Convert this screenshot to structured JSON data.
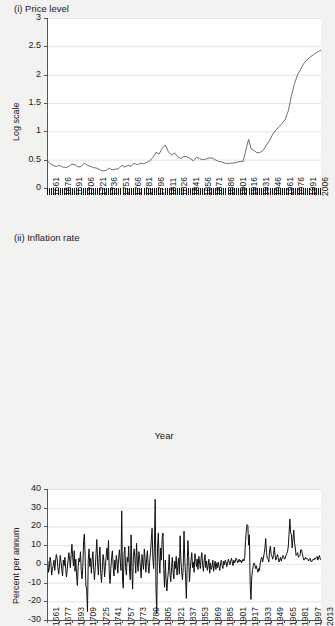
{
  "panels": {
    "price": {
      "title": "(i) Price level",
      "ylabel": "Log scale",
      "ytick_labels": [
        "3",
        "2.5",
        "2",
        "1.5",
        "1",
        "0.5",
        "0"
      ],
      "xtick_labels": [
        "1661",
        "1676",
        "1691",
        "1706",
        "1721",
        "1736",
        "1751",
        "1766",
        "1781",
        "1796",
        "1811",
        "1826",
        "1841",
        "1856",
        "1871",
        "1886",
        "1901",
        "1916",
        "1931",
        "1946",
        "1961",
        "1976",
        "1991",
        "2006"
      ]
    },
    "inflation": {
      "title": "(ii) Inflation rate",
      "ylabel": "Percent per annum",
      "xaxis_title": "Year",
      "ytick_labels": [
        "40",
        "30",
        "20",
        "10",
        "0",
        "-10",
        "-20",
        "-30"
      ],
      "xtick_labels": [
        "1661",
        "1677",
        "1693",
        "1709",
        "1725",
        "1741",
        "1757",
        "1773",
        "1789",
        "1805",
        "1821",
        "1837",
        "1853",
        "1869",
        "1885",
        "1901",
        "1917",
        "1933",
        "1949",
        "1965",
        "1981",
        "1997",
        "2013"
      ]
    }
  },
  "colors": {
    "page_background": "#f2f2f0",
    "plot_background": "#ffffff",
    "gridline": "#e3e3e3",
    "axis": "#55565a",
    "price_line": "#6e6e70",
    "inflation_line": "#111111",
    "text": "#1a1a1a"
  },
  "chart_data": [
    {
      "type": "line",
      "title": "(i) Price level",
      "xlabel": "",
      "ylabel": "Log scale",
      "xlim": [
        1661,
        2013
      ],
      "ylim": [
        0,
        3
      ],
      "yticks": [
        0,
        0.5,
        1,
        1.5,
        2,
        2.5,
        3
      ],
      "xticks": [
        1661,
        1676,
        1691,
        1706,
        1721,
        1736,
        1751,
        1766,
        1781,
        1796,
        1811,
        1826,
        1841,
        1856,
        1871,
        1886,
        1901,
        1916,
        1931,
        1946,
        1961,
        1976,
        1991,
        2006
      ],
      "grid": true,
      "legend": "none",
      "series": [
        {
          "name": "Price level (log scale)",
          "x": [
            1661,
            1665,
            1669,
            1673,
            1677,
            1681,
            1685,
            1689,
            1693,
            1697,
            1701,
            1705,
            1709,
            1713,
            1717,
            1721,
            1725,
            1729,
            1733,
            1737,
            1741,
            1745,
            1749,
            1753,
            1757,
            1761,
            1765,
            1769,
            1773,
            1777,
            1781,
            1785,
            1789,
            1793,
            1797,
            1801,
            1805,
            1809,
            1813,
            1817,
            1821,
            1825,
            1829,
            1833,
            1837,
            1841,
            1845,
            1849,
            1853,
            1857,
            1861,
            1865,
            1869,
            1873,
            1877,
            1881,
            1885,
            1889,
            1893,
            1897,
            1901,
            1905,
            1909,
            1913,
            1917,
            1920,
            1923,
            1927,
            1931,
            1935,
            1939,
            1943,
            1947,
            1951,
            1955,
            1959,
            1963,
            1967,
            1971,
            1975,
            1979,
            1983,
            1987,
            1991,
            1995,
            1999,
            2003,
            2007,
            2011,
            2013
          ],
          "y": [
            0.49,
            0.43,
            0.4,
            0.38,
            0.4,
            0.37,
            0.36,
            0.38,
            0.42,
            0.41,
            0.37,
            0.38,
            0.44,
            0.4,
            0.38,
            0.36,
            0.35,
            0.32,
            0.3,
            0.31,
            0.35,
            0.32,
            0.33,
            0.34,
            0.4,
            0.37,
            0.4,
            0.38,
            0.44,
            0.41,
            0.44,
            0.43,
            0.45,
            0.48,
            0.54,
            0.63,
            0.6,
            0.7,
            0.76,
            0.64,
            0.58,
            0.62,
            0.55,
            0.52,
            0.56,
            0.55,
            0.52,
            0.48,
            0.54,
            0.52,
            0.5,
            0.51,
            0.53,
            0.53,
            0.5,
            0.47,
            0.46,
            0.44,
            0.43,
            0.44,
            0.44,
            0.45,
            0.47,
            0.47,
            0.7,
            0.86,
            0.7,
            0.66,
            0.62,
            0.63,
            0.67,
            0.76,
            0.84,
            0.95,
            1.02,
            1.08,
            1.14,
            1.21,
            1.36,
            1.63,
            1.84,
            2.0,
            2.1,
            2.2,
            2.26,
            2.31,
            2.35,
            2.39,
            2.42,
            2.43
          ]
        }
      ]
    },
    {
      "type": "line",
      "title": "(ii) Inflation rate",
      "xlabel": "Year",
      "ylabel": "Percent per annum",
      "xlim": [
        1661,
        2013
      ],
      "ylim": [
        -30,
        40
      ],
      "yticks": [
        -30,
        -20,
        -10,
        0,
        10,
        20,
        30,
        40
      ],
      "xticks": [
        1661,
        1677,
        1693,
        1709,
        1725,
        1741,
        1757,
        1773,
        1789,
        1805,
        1821,
        1837,
        1853,
        1869,
        1885,
        1901,
        1917,
        1933,
        1949,
        1965,
        1981,
        1997,
        2013
      ],
      "grid": true,
      "legend": "none",
      "annotations": [
        {
          "label": "1709 dearth",
          "x": 1709,
          "y": -25.5
        },
        {
          "label": "1757 harvest failure",
          "x": 1757,
          "y": 28.3
        },
        {
          "label": "1800 scarcity",
          "x": 1800,
          "y": 34.5
        },
        {
          "label": "1802 collapse",
          "x": 1802,
          "y": -26.5
        },
        {
          "label": "WWI peak",
          "x": 1917,
          "y": 21.0
        },
        {
          "label": "1921 deflation",
          "x": 1921,
          "y": -19.0
        },
        {
          "label": "1975 peak",
          "x": 1975,
          "y": 24.0
        }
      ],
      "series": [
        {
          "name": "Inflation rate (percent per annum)",
          "x": [
            1661,
            1662,
            1663,
            1664,
            1665,
            1666,
            1667,
            1668,
            1669,
            1670,
            1671,
            1672,
            1673,
            1674,
            1675,
            1676,
            1677,
            1678,
            1679,
            1680,
            1681,
            1682,
            1683,
            1684,
            1685,
            1686,
            1687,
            1688,
            1689,
            1690,
            1691,
            1692,
            1693,
            1694,
            1695,
            1696,
            1697,
            1698,
            1699,
            1700,
            1701,
            1702,
            1703,
            1704,
            1705,
            1706,
            1707,
            1708,
            1709,
            1710,
            1711,
            1712,
            1713,
            1714,
            1715,
            1716,
            1717,
            1718,
            1719,
            1720,
            1721,
            1722,
            1723,
            1724,
            1725,
            1726,
            1727,
            1728,
            1729,
            1730,
            1731,
            1732,
            1733,
            1734,
            1735,
            1736,
            1737,
            1738,
            1739,
            1740,
            1741,
            1742,
            1743,
            1744,
            1745,
            1746,
            1747,
            1748,
            1749,
            1750,
            1751,
            1752,
            1753,
            1754,
            1755,
            1756,
            1757,
            1758,
            1759,
            1760,
            1761,
            1762,
            1763,
            1764,
            1765,
            1766,
            1767,
            1768,
            1769,
            1770,
            1771,
            1772,
            1773,
            1774,
            1775,
            1776,
            1777,
            1778,
            1779,
            1780,
            1781,
            1782,
            1783,
            1784,
            1785,
            1786,
            1787,
            1788,
            1789,
            1790,
            1791,
            1792,
            1793,
            1794,
            1795,
            1796,
            1797,
            1798,
            1799,
            1800,
            1801,
            1802,
            1803,
            1804,
            1805,
            1806,
            1807,
            1808,
            1809,
            1810,
            1811,
            1812,
            1813,
            1814,
            1815,
            1816,
            1817,
            1818,
            1819,
            1820,
            1821,
            1822,
            1823,
            1824,
            1825,
            1826,
            1827,
            1828,
            1829,
            1830,
            1831,
            1832,
            1833,
            1834,
            1835,
            1836,
            1837,
            1838,
            1839,
            1840,
            1841,
            1842,
            1843,
            1844,
            1845,
            1846,
            1847,
            1848,
            1849,
            1850,
            1851,
            1852,
            1853,
            1854,
            1855,
            1856,
            1857,
            1858,
            1859,
            1860,
            1861,
            1862,
            1863,
            1864,
            1865,
            1866,
            1867,
            1868,
            1869,
            1870,
            1871,
            1872,
            1873,
            1874,
            1875,
            1876,
            1877,
            1878,
            1879,
            1880,
            1881,
            1882,
            1883,
            1884,
            1885,
            1886,
            1887,
            1888,
            1889,
            1890,
            1891,
            1892,
            1893,
            1894,
            1895,
            1896,
            1897,
            1898,
            1899,
            1900,
            1901,
            1902,
            1903,
            1904,
            1905,
            1906,
            1907,
            1908,
            1909,
            1910,
            1911,
            1912,
            1913,
            1914,
            1915,
            1916,
            1917,
            1918,
            1919,
            1920,
            1921,
            1922,
            1923,
            1924,
            1925,
            1926,
            1927,
            1928,
            1929,
            1930,
            1931,
            1932,
            1933,
            1934,
            1935,
            1936,
            1937,
            1938,
            1939,
            1940,
            1941,
            1942,
            1943,
            1944,
            1945,
            1946,
            1947,
            1948,
            1949,
            1950,
            1951,
            1952,
            1953,
            1954,
            1955,
            1956,
            1957,
            1958,
            1959,
            1960,
            1961,
            1962,
            1963,
            1964,
            1965,
            1966,
            1967,
            1968,
            1969,
            1970,
            1971,
            1972,
            1973,
            1974,
            1975,
            1976,
            1977,
            1978,
            1979,
            1980,
            1981,
            1982,
            1983,
            1984,
            1985,
            1986,
            1987,
            1988,
            1989,
            1990,
            1991,
            1992,
            1993,
            1994,
            1995,
            1996,
            1997,
            1998,
            1999,
            2000,
            2001,
            2002,
            2003,
            2004,
            2005,
            2006,
            2007,
            2008,
            2009,
            2010,
            2011,
            2012,
            2013
          ],
          "y": [
            -3.0,
            1.5,
            -4.5,
            -2.0,
            3.5,
            1.0,
            -6.0,
            -2.5,
            -1.0,
            2.0,
            -3.5,
            1.5,
            5.0,
            3.0,
            -2.0,
            -5.5,
            -1.5,
            4.5,
            1.0,
            -3.0,
            -6.5,
            2.0,
            -1.0,
            3.5,
            -2.5,
            -7.0,
            -3.0,
            1.5,
            6.0,
            3.0,
            -2.0,
            5.0,
            10.5,
            3.5,
            -1.0,
            7.0,
            -4.0,
            2.5,
            -6.0,
            -11.5,
            -2.0,
            3.0,
            1.0,
            6.5,
            -3.5,
            -8.0,
            -2.0,
            12.0,
            16.0,
            4.0,
            -12.0,
            -13.5,
            -25.5,
            2.0,
            8.0,
            -1.5,
            3.0,
            -5.0,
            2.5,
            6.5,
            -3.0,
            -8.5,
            -2.0,
            5.5,
            13.0,
            0.5,
            -6.0,
            3.0,
            9.0,
            -4.5,
            -10.0,
            -3.0,
            5.0,
            2.0,
            -7.0,
            -1.5,
            4.0,
            8.5,
            2.0,
            12.5,
            -5.0,
            -10.5,
            -2.5,
            3.5,
            7.0,
            -1.0,
            -6.5,
            2.0,
            -3.0,
            4.5,
            1.0,
            -5.0,
            3.0,
            7.5,
            2.0,
            -3.5,
            28.3,
            -8.0,
            -13.0,
            5.0,
            9.0,
            -2.0,
            -6.0,
            3.5,
            1.0,
            9.5,
            -4.0,
            -8.5,
            15.5,
            -2.0,
            -13.5,
            4.0,
            8.0,
            2.5,
            -5.0,
            11.0,
            1.5,
            -4.0,
            6.5,
            3.0,
            -2.0,
            -7.5,
            5.0,
            1.0,
            -3.0,
            8.0,
            2.5,
            -4.5,
            3.0,
            7.0,
            -1.5,
            -5.0,
            2.0,
            6.0,
            13.0,
            19.0,
            3.0,
            -2.5,
            10.0,
            34.5,
            -13.0,
            -26.5,
            9.0,
            16.5,
            3.0,
            -5.0,
            8.5,
            2.0,
            14.0,
            16.5,
            -3.0,
            -12.5,
            2.0,
            -9.0,
            -14.5,
            -8.0,
            -3.5,
            5.0,
            -6.0,
            -9.5,
            -2.0,
            3.5,
            -4.5,
            -8.0,
            1.5,
            -2.5,
            4.0,
            -6.0,
            -1.0,
            3.0,
            -5.5,
            15.0,
            2.0,
            -4.0,
            -8.5,
            -2.0,
            17.5,
            3.0,
            -6.5,
            -18.5,
            -3.0,
            12.5,
            4.0,
            -9.5,
            -3.0,
            2.0,
            6.0,
            -2.0,
            1.0,
            -4.5,
            5.5,
            3.0,
            -1.5,
            2.5,
            -3.0,
            4.0,
            1.0,
            -2.5,
            3.5,
            6.0,
            -1.0,
            -4.0,
            2.0,
            5.0,
            -2.0,
            1.5,
            -3.5,
            -1.0,
            2.5,
            -5.0,
            0.5,
            -3.0,
            -1.5,
            2.0,
            -4.0,
            -1.0,
            1.5,
            -3.0,
            0.5,
            -2.0,
            1.0,
            -1.5,
            -3.5,
            0.5,
            2.0,
            -1.0,
            -2.5,
            1.5,
            -0.5,
            2.0,
            1.0,
            -1.5,
            0.5,
            2.5,
            1.0,
            -0.5,
            1.5,
            3.0,
            1.0,
            -1.0,
            2.0,
            0.5,
            1.5,
            3.0,
            2.0,
            0.5,
            1.5,
            2.5,
            1.0,
            2.0,
            0.5,
            1.5,
            2.5,
            1.5,
            3.5,
            12.0,
            17.5,
            21.0,
            20.5,
            10.0,
            15.5,
            -11.0,
            -19.0,
            -7.0,
            -3.5,
            -1.0,
            0.5,
            -0.5,
            -2.5,
            -1.0,
            -3.0,
            -4.5,
            -2.5,
            -3.5,
            0.5,
            2.5,
            3.5,
            1.0,
            3.0,
            5.5,
            8.5,
            13.5,
            6.0,
            3.0,
            2.5,
            1.0,
            7.5,
            9.5,
            5.0,
            4.0,
            2.5,
            5.0,
            9.0,
            4.5,
            2.0,
            3.5,
            5.0,
            3.5,
            1.0,
            2.0,
            3.5,
            1.5,
            3.0,
            4.5,
            4.0,
            2.5,
            3.0,
            4.5,
            5.5,
            6.5,
            9.5,
            16.5,
            24.0,
            16.5,
            15.5,
            8.5,
            13.5,
            18.0,
            11.5,
            8.5,
            4.5,
            5.0,
            6.0,
            3.5,
            4.0,
            4.5,
            7.5,
            7.5,
            5.5,
            3.5,
            2.0,
            2.5,
            3.5,
            2.5,
            3.0,
            2.5,
            1.5,
            2.5,
            3.0,
            1.5,
            1.0,
            2.0,
            2.5,
            2.0,
            3.0,
            2.5,
            3.5,
            4.0,
            2.0,
            3.5,
            4.5,
            2.5,
            2.0
          ]
        }
      ]
    }
  ]
}
